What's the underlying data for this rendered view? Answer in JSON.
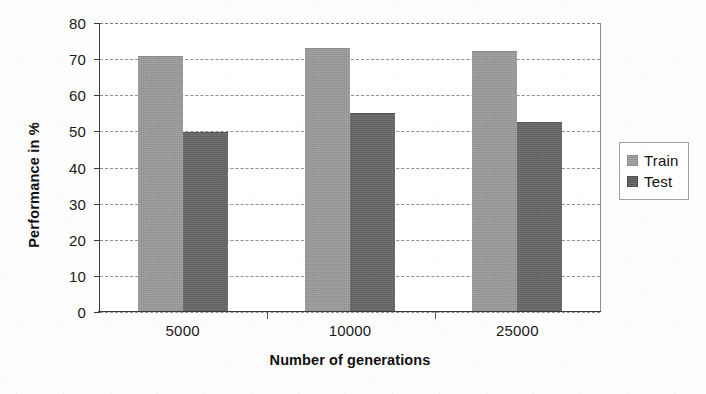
{
  "chart_data": {
    "type": "bar",
    "title": "",
    "xlabel": "Number of generations",
    "ylabel": "Performance in %",
    "categories": [
      "5000",
      "10000",
      "25000"
    ],
    "series": [
      {
        "name": "Train",
        "values": [
          71.0,
          73.0,
          72.3
        ],
        "color": "#9c9c9c"
      },
      {
        "name": "Test",
        "values": [
          49.7,
          55.0,
          52.5
        ],
        "color": "#676767"
      }
    ],
    "ylim": [
      0,
      80
    ],
    "ytick_labels": [
      "0",
      "10",
      "20",
      "30",
      "40",
      "50",
      "60",
      "70",
      "80"
    ],
    "ytick_values": [
      0,
      10,
      20,
      30,
      40,
      50,
      60,
      70,
      80
    ],
    "grid": true,
    "grid_style": "dashed-horizontal",
    "legend_position": "right",
    "legend_entries": [
      "Train",
      "Test"
    ]
  },
  "legend": {
    "entries": [
      {
        "label": "Train"
      },
      {
        "label": "Test"
      }
    ]
  },
  "axes": {
    "x_title": "Number of generations",
    "y_title": "Performance in %"
  },
  "colors": {
    "train": "#9c9c9c",
    "test": "#676767",
    "axis": "#3a3a3a",
    "grid": "#909090",
    "background": "#ffffff"
  }
}
